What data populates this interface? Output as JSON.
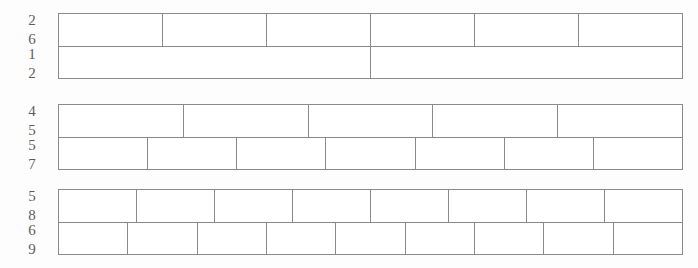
{
  "page": {
    "background_color": "#fdfdfd",
    "line_color": "#8a8a8a",
    "bar_fill_color": "#ffffff",
    "label_color": "#5d5d5d"
  },
  "chart_data": {
    "type": "bar",
    "xlabel": "",
    "ylabel": "",
    "categories": [
      "2/6",
      "1/2",
      "4/5",
      "5/7",
      "5/8",
      "6/9"
    ],
    "values": [
      6,
      2,
      5,
      7,
      8,
      9
    ]
  },
  "groups": [
    {
      "id": "group-1",
      "rows": [
        {
          "label": "2/6",
          "numerator": "2",
          "denominator": "6",
          "segments": 6
        },
        {
          "label": "1/2",
          "numerator": "1",
          "denominator": "2",
          "segments": 2
        }
      ]
    },
    {
      "id": "group-2",
      "rows": [
        {
          "label": "4/5",
          "numerator": "4",
          "denominator": "5",
          "segments": 5
        },
        {
          "label": "5/7",
          "numerator": "5",
          "denominator": "7",
          "segments": 7
        }
      ]
    },
    {
      "id": "group-3",
      "rows": [
        {
          "label": "5/8",
          "numerator": "5",
          "denominator": "8",
          "segments": 8
        },
        {
          "label": "6/9",
          "numerator": "6",
          "denominator": "9",
          "segments": 9
        }
      ]
    }
  ]
}
